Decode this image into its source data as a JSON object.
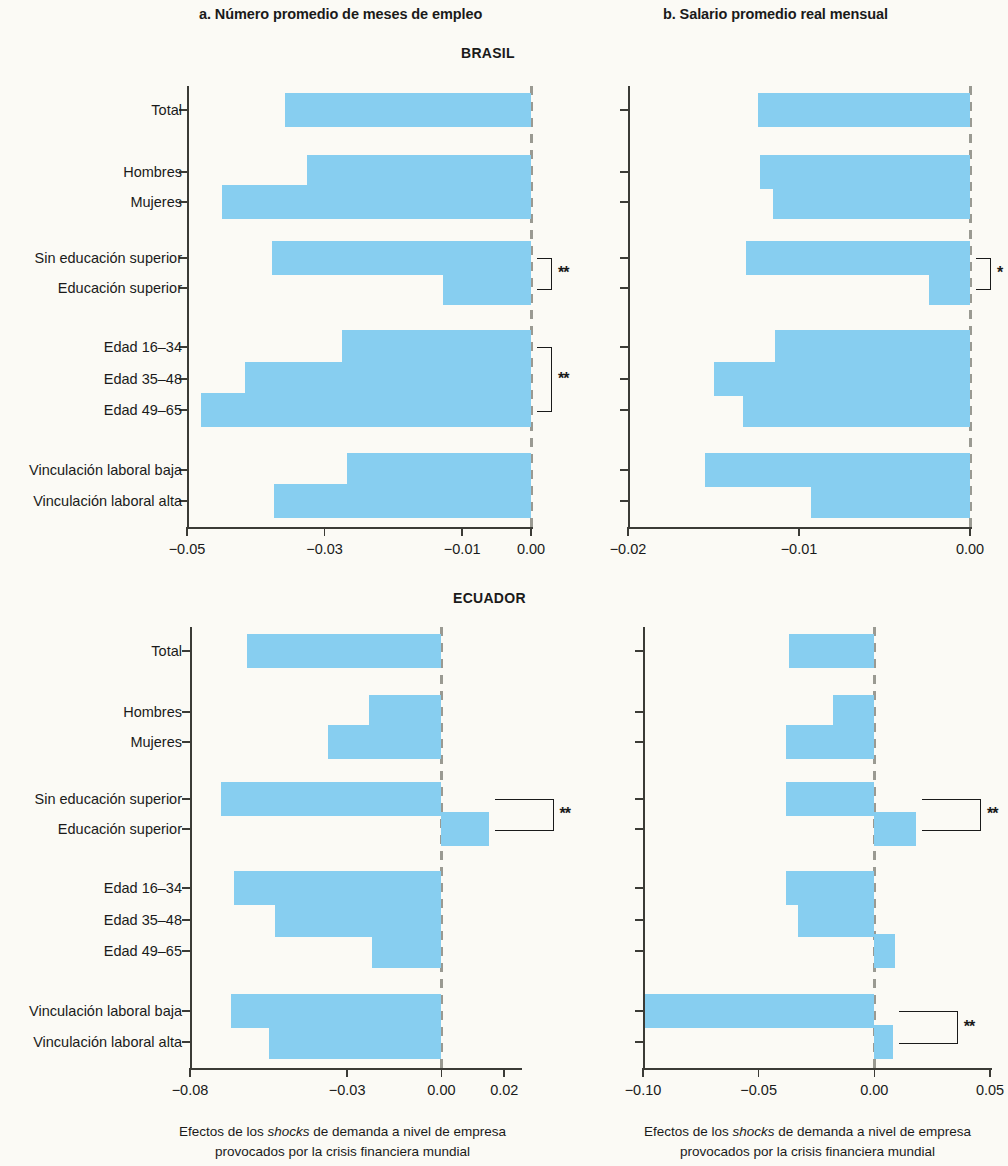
{
  "figure": {
    "panel_a_title": "a. Número promedio de meses de empleo",
    "panel_b_title": "b. Salario promedio real mensual",
    "country_brasil": "BRASIL",
    "country_ecuador": "ECUADOR",
    "caption_line1_pre": "Efectos de los ",
    "caption_line1_italic": "shocks",
    "caption_line1_post": " de demanda a nivel de empresa",
    "caption_line2": "provocados por la crisis financiera mundial",
    "bar_color": "#87cef0",
    "axis_color": "#3b3b36",
    "zero_line_color": "#9a9a92"
  },
  "categories": [
    "Total",
    "Hombres",
    "Mujeres",
    "Sin educación superior",
    "Educación superior",
    "Edad 16–34",
    "Edad 35–48",
    "Edad 49–65",
    "Vinculación laboral baja",
    "Vinculación laboral alta"
  ],
  "chart_data": [
    {
      "id": "brasil-a",
      "type": "bar",
      "orientation": "horizontal",
      "title": "a. Número promedio de meses de empleo",
      "group": "BRASIL",
      "xlabel": "Efectos de los shocks de demanda a nivel de empresa provocados por la crisis financiera mundial",
      "ylabel": "",
      "categories": [
        "Total",
        "Hombres",
        "Mujeres",
        "Sin educación superior",
        "Educación superior",
        "Edad 16–34",
        "Edad 35–48",
        "Edad 49–65",
        "Vinculación laboral baja",
        "Vinculación laboral alta"
      ],
      "values": [
        -0.0357,
        -0.0326,
        -0.0449,
        -0.0376,
        -0.0128,
        -0.0274,
        -0.0415,
        -0.048,
        -0.0267,
        -0.0374
      ],
      "xlim": [
        -0.05,
        0.0
      ],
      "xticks": [
        -0.05,
        -0.03,
        -0.01,
        0.0
      ],
      "xticklabels": [
        "−0.05",
        "−0.03",
        "−0.01",
        "0.00"
      ],
      "grid": false,
      "annotations": [
        {
          "label": "**",
          "between": [
            "Sin educación superior",
            "Educación superior"
          ],
          "side": "right"
        },
        {
          "label": "**",
          "between": [
            "Edad 16–34",
            "Edad 49–65"
          ],
          "side": "right"
        }
      ]
    },
    {
      "id": "brasil-b",
      "type": "bar",
      "orientation": "horizontal",
      "title": "b. Salario promedio real mensual",
      "group": "BRASIL",
      "xlabel": "Efectos de los shocks de demanda a nivel de empresa provocados por la crisis financiera mundial",
      "ylabel": "",
      "categories": [
        "Total",
        "Hombres",
        "Mujeres",
        "Sin educación superior",
        "Educación superior",
        "Edad 16–34",
        "Edad 35–48",
        "Edad 49–65",
        "Vinculación laboral baja",
        "Vinculación laboral alta"
      ],
      "values": [
        -0.0124,
        -0.0123,
        -0.0115,
        -0.0131,
        -0.0024,
        -0.0114,
        -0.015,
        -0.0133,
        -0.0155,
        -0.0093
      ],
      "xlim": [
        -0.02,
        0.0
      ],
      "xticks": [
        -0.02,
        -0.01,
        0.0
      ],
      "xticklabels": [
        "−0.02",
        "−0.01",
        "0.00"
      ],
      "grid": false,
      "annotations": [
        {
          "label": "*",
          "between": [
            "Sin educación superior",
            "Educación superior"
          ],
          "side": "right"
        }
      ]
    },
    {
      "id": "ecuador-a",
      "type": "bar",
      "orientation": "horizontal",
      "title": "a. Número promedio de meses de empleo",
      "group": "ECUADOR",
      "xlabel": "Efectos de los shocks de demanda a nivel de empresa provocados por la crisis financiera mundial",
      "ylabel": "",
      "categories": [
        "Total",
        "Hombres",
        "Mujeres",
        "Sin educación superior",
        "Educación superior",
        "Edad 16–34",
        "Edad 35–48",
        "Edad 49–65",
        "Vinculación laboral baja",
        "Vinculación laboral alta"
      ],
      "values": [
        -0.062,
        -0.023,
        -0.036,
        -0.07,
        0.015,
        -0.066,
        -0.053,
        -0.022,
        -0.067,
        -0.055
      ],
      "xlim": [
        -0.08,
        0.025
      ],
      "xticks": [
        -0.08,
        -0.03,
        0.0,
        0.02
      ],
      "xticklabels": [
        "−0.08",
        "−0.03",
        "0.00",
        "0.02"
      ],
      "grid": false,
      "annotations": [
        {
          "label": "**",
          "between": [
            "Sin educación superior",
            "Educación superior"
          ],
          "side": "right"
        }
      ]
    },
    {
      "id": "ecuador-b",
      "type": "bar",
      "orientation": "horizontal",
      "title": "b. Salario promedio real mensual",
      "group": "ECUADOR",
      "xlabel": "Efectos de los shocks de demanda a nivel de empresa provocados por la crisis financiera mundial",
      "ylabel": "",
      "categories": [
        "Total",
        "Hombres",
        "Mujeres",
        "Sin educación superior",
        "Educación superior",
        "Edad 16–34",
        "Edad 35–48",
        "Edad 49–65",
        "Vinculación laboral baja",
        "Vinculación laboral alta"
      ],
      "values": [
        -0.037,
        -0.018,
        -0.038,
        -0.038,
        0.018,
        -0.038,
        -0.033,
        0.009,
        -0.099,
        0.008
      ],
      "xlim": [
        -0.1,
        0.05
      ],
      "xticks": [
        -0.1,
        -0.05,
        0.0,
        0.05
      ],
      "xticklabels": [
        "−0.10",
        "−0.05",
        "0.00",
        "0.05"
      ],
      "grid": false,
      "annotations": [
        {
          "label": "**",
          "between": [
            "Sin educación superior",
            "Educación superior"
          ],
          "side": "right"
        },
        {
          "label": "**",
          "between": [
            "Vinculación laboral baja",
            "Vinculación laboral alta"
          ],
          "side": "right"
        }
      ]
    }
  ]
}
